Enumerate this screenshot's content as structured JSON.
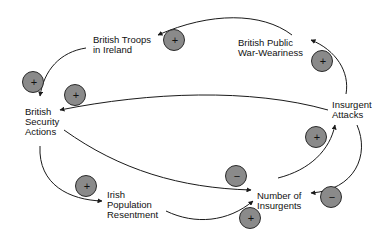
{
  "diagram": {
    "type": "causal-loop",
    "nodes": [
      {
        "id": "troops",
        "label": "British Troops\nin Ireland",
        "x": 93,
        "y": 35
      },
      {
        "id": "weariness",
        "label": "British Public\nWar-Weariness",
        "x": 238,
        "y": 38
      },
      {
        "id": "security",
        "label": "British\nSecurity\nActions",
        "x": 25,
        "y": 107
      },
      {
        "id": "attacks",
        "label": "Insurgent\nAttacks",
        "x": 332,
        "y": 100
      },
      {
        "id": "resentment",
        "label": "Irish\nPopulation\nResentment",
        "x": 107,
        "y": 190
      },
      {
        "id": "insurgents",
        "label": "Number of\nInsurgents",
        "x": 257,
        "y": 191
      }
    ],
    "polarity_markers": [
      {
        "id": "p-weariness-troops",
        "sign": "+",
        "cx": 174,
        "cy": 40
      },
      {
        "id": "p-attacks-weariness",
        "sign": "+",
        "cx": 322,
        "cy": 61
      },
      {
        "id": "p-troops-security",
        "sign": "+",
        "cx": 33,
        "cy": 82
      },
      {
        "id": "p-attacks-security",
        "sign": "+",
        "cx": 75,
        "cy": 95
      },
      {
        "id": "p-insurgents-attacks",
        "sign": "+",
        "cx": 316,
        "cy": 137
      },
      {
        "id": "p-security-resentment",
        "sign": "+",
        "cx": 86,
        "cy": 186
      },
      {
        "id": "p-security-insurgents",
        "sign": "−",
        "cx": 236,
        "cy": 176
      },
      {
        "id": "p-attacks-insurgents",
        "sign": "−",
        "cx": 331,
        "cy": 197
      },
      {
        "id": "p-resentment-insurgents",
        "sign": "+",
        "cx": 250,
        "cy": 218
      }
    ],
    "edges": [
      {
        "from": "weariness",
        "to": "troops",
        "polarity": "+"
      },
      {
        "from": "troops",
        "to": "security",
        "polarity": "+"
      },
      {
        "from": "attacks",
        "to": "security",
        "polarity": "+"
      },
      {
        "from": "attacks",
        "to": "weariness",
        "polarity": "+"
      },
      {
        "from": "security",
        "to": "resentment",
        "polarity": "+"
      },
      {
        "from": "security",
        "to": "insurgents",
        "polarity": "−"
      },
      {
        "from": "resentment",
        "to": "insurgents",
        "polarity": "+"
      },
      {
        "from": "insurgents",
        "to": "attacks",
        "polarity": "+"
      },
      {
        "from": "attacks",
        "to": "insurgents",
        "polarity": "−"
      }
    ],
    "colors": {
      "marker_fill": "#8a8a8a",
      "marker_stroke": "#2a2a2a",
      "line": "#1a1a1a",
      "text": "#111111"
    }
  }
}
